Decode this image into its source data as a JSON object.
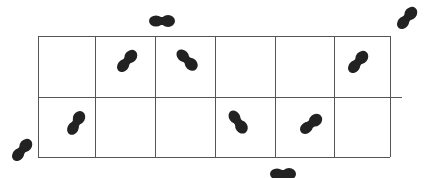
{
  "diagram": {
    "grid": {
      "rows": 2,
      "cols": 6,
      "x0": 38,
      "y0": 36,
      "col_edges": [
        38,
        95,
        155,
        215,
        275,
        334,
        390
      ],
      "row_edges": [
        36,
        97,
        157
      ],
      "line_color": "#555555",
      "extended_middle_line_end": 402
    },
    "footprint_color": "#222222",
    "footprints": [
      {
        "id": "outside-top",
        "cx": 162,
        "cy": 21,
        "angle": 0,
        "location": "outside above grid"
      },
      {
        "id": "outside-top-right",
        "cx": 407,
        "cy": 18,
        "angle": -50,
        "location": "outside top right"
      },
      {
        "id": "r1c2",
        "cx": 127,
        "cy": 61,
        "angle": -50,
        "location": "row 1, col 2"
      },
      {
        "id": "r1c3",
        "cx": 187,
        "cy": 60,
        "angle": 45,
        "location": "row 1, col 3"
      },
      {
        "id": "r1c6",
        "cx": 358,
        "cy": 62,
        "angle": -50,
        "location": "row 1, col 6"
      },
      {
        "id": "r2c1",
        "cx": 76,
        "cy": 123,
        "angle": -60,
        "location": "row 2, col 1"
      },
      {
        "id": "r2c4",
        "cx": 238,
        "cy": 122,
        "angle": 55,
        "location": "row 2, col 4"
      },
      {
        "id": "r2c5",
        "cx": 311,
        "cy": 124,
        "angle": -40,
        "location": "row 2, col 5"
      },
      {
        "id": "outside-bottom-left",
        "cx": 22,
        "cy": 150,
        "angle": -50,
        "location": "outside bottom left"
      },
      {
        "id": "outside-bottom",
        "cx": 283,
        "cy": 174,
        "angle": 0,
        "location": "outside below grid"
      }
    ]
  }
}
